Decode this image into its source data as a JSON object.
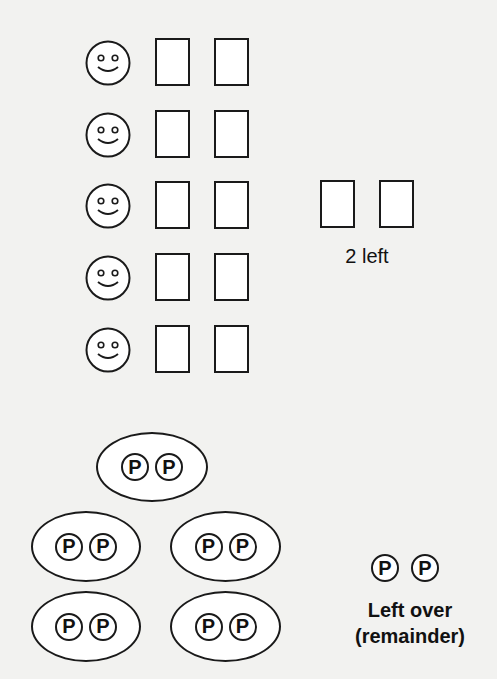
{
  "top_section": {
    "description": "5 smiley faces each with 2 cards, plus 2 cards left over",
    "rows": [
      {
        "smiley": "smiley-icon",
        "cards": 2
      },
      {
        "smiley": "smiley-icon",
        "cards": 2
      },
      {
        "smiley": "smiley-icon",
        "cards": 2
      },
      {
        "smiley": "smiley-icon",
        "cards": 2
      },
      {
        "smiley": "smiley-icon",
        "cards": 2
      }
    ],
    "leftover_cards": 2,
    "leftover_label": "2 left"
  },
  "bottom_section": {
    "description": "5 groups of 2 P-tokens each, plus 2 left over",
    "token_glyph": "P",
    "groups": [
      {
        "tokens": [
          "P",
          "P"
        ]
      },
      {
        "tokens": [
          "P",
          "P"
        ]
      },
      {
        "tokens": [
          "P",
          "P"
        ]
      },
      {
        "tokens": [
          "P",
          "P"
        ]
      },
      {
        "tokens": [
          "P",
          "P"
        ]
      }
    ],
    "leftover_tokens": [
      "P",
      "P"
    ],
    "leftover_label_line1": "Left over",
    "leftover_label_line2": "(remainder)"
  },
  "colors": {
    "background": "#f2f2f0",
    "stroke": "#1a1a1a",
    "fill": "#ffffff"
  }
}
